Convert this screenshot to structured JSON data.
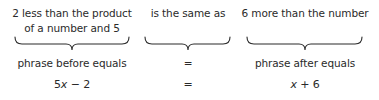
{
  "columns": [
    {
      "phrase_lines": [
        "2 less than the  product",
        "of a number and 5"
      ],
      "label": "phrase before equals",
      "expression": {
        "parts": [
          "5",
          "x",
          " − 2"
        ]
      }
    },
    {
      "phrase_lines": [
        "is the same as"
      ],
      "label": "=",
      "expression": {
        "parts": [
          "",
          "",
          "="
        ]
      }
    },
    {
      "phrase_lines": [
        "6 more than the number"
      ],
      "label": "phrase after equals",
      "expression": {
        "parts": [
          "",
          "x",
          " + 6"
        ]
      }
    }
  ]
}
